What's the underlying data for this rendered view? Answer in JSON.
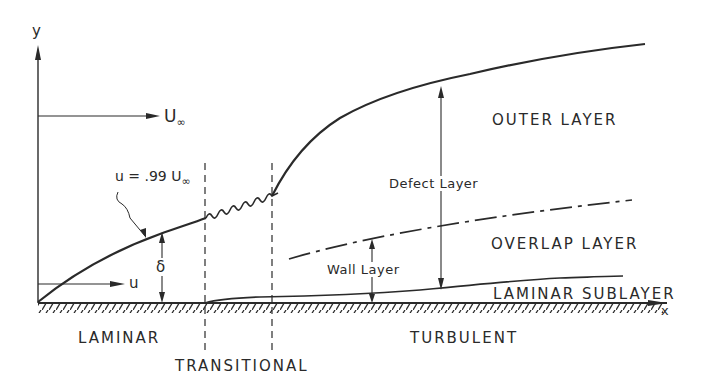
{
  "diagram": {
    "axes": {
      "y_label": "y",
      "x_label": "x"
    },
    "freestream": {
      "label_main": "U",
      "label_sub": "∞"
    },
    "edge_curve": {
      "label_prefix": "u = .99 U",
      "label_sub": "∞"
    },
    "velocity": {
      "label": "u"
    },
    "thickness": {
      "symbol": "δ"
    },
    "regions": {
      "outer": "OUTER LAYER",
      "overlap": "OVERLAP LAYER",
      "sublayer": "LAMINAR SUBLAYER",
      "defect": "Defect Layer",
      "wall": "Wall Layer"
    },
    "regimes": {
      "laminar": "LAMINAR",
      "transitional": "TRANSITIONAL",
      "turbulent": "TURBULENT"
    },
    "colors": {
      "ink": "#2a2a2a",
      "background": "#ffffff"
    }
  }
}
